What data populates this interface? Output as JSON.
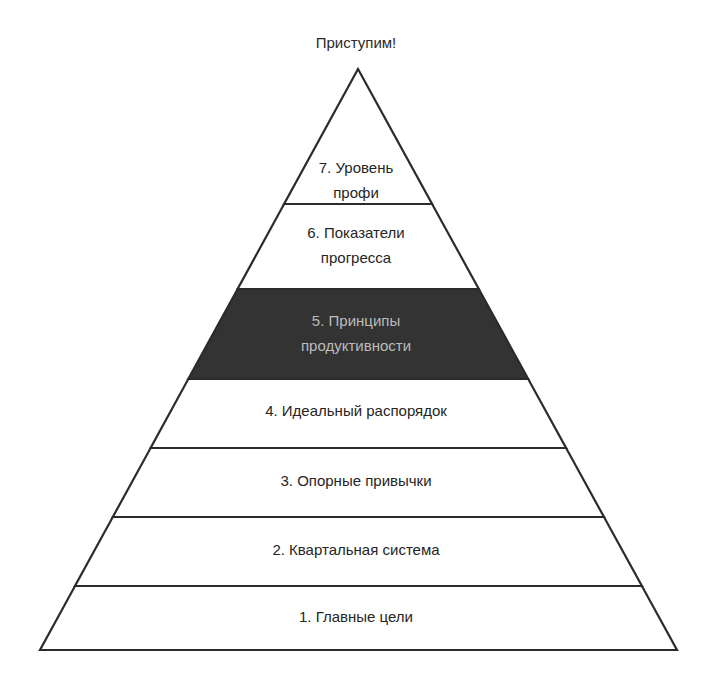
{
  "title": "Приступим!",
  "colors": {
    "outline": "#2b2b2b",
    "layer_fill": "#ffffff",
    "highlight_fill": "#333333",
    "text": "#252525",
    "highlight_text": "#bcbcbc"
  },
  "pyramid": {
    "apex": [
      358,
      69
    ],
    "base_left": [
      40,
      650
    ],
    "base_right": [
      677,
      650
    ],
    "layers": [
      {
        "level": 7,
        "line1": "7. Уровень",
        "line2": "профи",
        "top": 69,
        "bottom": 204,
        "highlight": false
      },
      {
        "level": 6,
        "line1": "6. Показатели",
        "line2": "прогресса",
        "top": 204,
        "bottom": 289,
        "highlight": false
      },
      {
        "level": 5,
        "line1": "5. Принципы",
        "line2": "продуктивности",
        "top": 289,
        "bottom": 379,
        "highlight": true
      },
      {
        "level": 4,
        "line1": "4. Идеальный распорядок",
        "line2": "",
        "top": 379,
        "bottom": 448,
        "highlight": false
      },
      {
        "level": 3,
        "line1": "3. Опорные привычки",
        "line2": "",
        "top": 448,
        "bottom": 517,
        "highlight": false
      },
      {
        "level": 2,
        "line1": "2. Квартальная система",
        "line2": "",
        "top": 517,
        "bottom": 586,
        "highlight": false
      },
      {
        "level": 1,
        "line1": "1. Главные цели",
        "line2": "",
        "top": 586,
        "bottom": 650,
        "highlight": false
      }
    ]
  }
}
